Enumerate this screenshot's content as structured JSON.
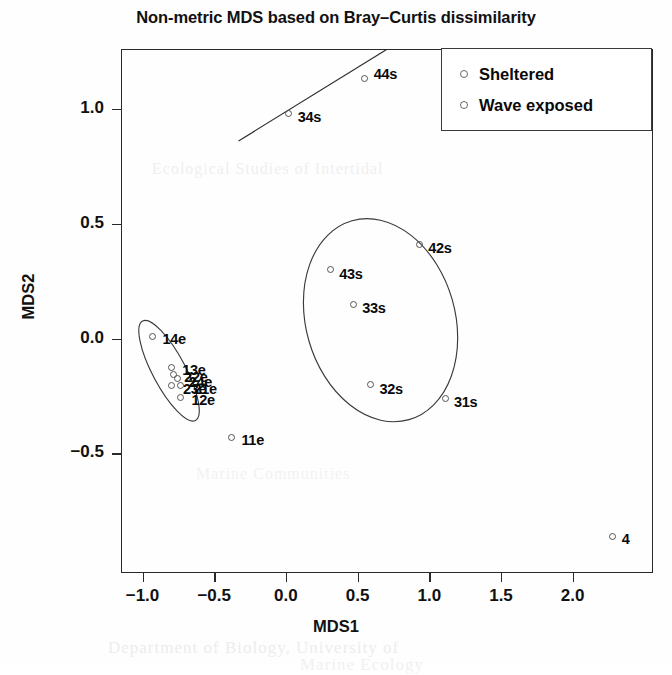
{
  "chart_data": {
    "type": "scatter",
    "title": "Non-metric MDS based on Bray–Curtis dissimilarity",
    "xlabel": "MDS1",
    "ylabel": "MDS2",
    "xlim": [
      -1.15,
      2.56
    ],
    "ylim": [
      -1.02,
      1.26
    ],
    "xticks": [
      "-1.0",
      "-0.5",
      "0.0",
      "0.5",
      "1.0",
      "1.5",
      "2.0"
    ],
    "xtickvalues": [
      -1.0,
      -0.5,
      0.0,
      0.5,
      1.0,
      1.5,
      2.0
    ],
    "yticks": [
      "-0.5",
      "0.0",
      "0.5",
      "1.0"
    ],
    "ytickvalues": [
      -0.5,
      0.0,
      0.5,
      1.0
    ],
    "grid": false,
    "legend_position": "top-right",
    "marker": "open-circle",
    "series": [
      {
        "name": "Sheltered",
        "suffix": "s",
        "points": [
          {
            "label": "44s",
            "x": 0.55,
            "y": 1.13,
            "label_dx": 9,
            "label_dy": -13
          },
          {
            "label": "34s",
            "x": 0.02,
            "y": 0.98,
            "label_dx": 9,
            "label_dy": -4
          },
          {
            "label": "42s",
            "x": 0.93,
            "y": 0.41,
            "label_dx": 9,
            "label_dy": -4
          },
          {
            "label": "43s",
            "x": 0.31,
            "y": 0.3,
            "label_dx": 9,
            "label_dy": -4
          },
          {
            "label": "33s",
            "x": 0.47,
            "y": 0.15,
            "label_dx": 9,
            "label_dy": -4
          },
          {
            "label": "32s",
            "x": 0.59,
            "y": -0.2,
            "label_dx": 9,
            "label_dy": -4
          },
          {
            "label": "31s",
            "x": 1.11,
            "y": -0.26,
            "label_dx": 9,
            "label_dy": -4
          },
          {
            "label": "4",
            "x": 2.28,
            "y": -0.86,
            "label_dx": 9,
            "label_dy": -5
          }
        ]
      },
      {
        "name": "Wave exposed",
        "suffix": "e",
        "points": [
          {
            "label": "14e",
            "x": -0.93,
            "y": 0.01,
            "label_dx": 10,
            "label_dy": -5
          },
          {
            "label": "13e",
            "x": -0.8,
            "y": -0.125,
            "label_dx": 11,
            "label_dy": -5
          },
          {
            "label": "22e",
            "x": -0.785,
            "y": -0.155,
            "label_dx": 11,
            "label_dy": -5
          },
          {
            "label": "24e",
            "x": -0.755,
            "y": -0.175,
            "label_dx": 11,
            "label_dy": -5
          },
          {
            "label": "23e",
            "x": -0.795,
            "y": -0.205,
            "label_dx": 11,
            "label_dy": -5
          },
          {
            "label": "21e",
            "x": -0.735,
            "y": -0.205,
            "label_dx": 13,
            "label_dy": -5
          },
          {
            "label": "12e",
            "x": -0.735,
            "y": -0.255,
            "label_dx": 11,
            "label_dy": -5
          },
          {
            "label": "11e",
            "x": -0.38,
            "y": -0.43,
            "label_dx": 10,
            "label_dy": -5
          }
        ]
      }
    ],
    "hulls": [
      {
        "name": "sheltered-ellipse",
        "shape": "ellipse",
        "cx": 0.66,
        "cy": 0.08,
        "rx": 0.52,
        "ry": 0.45,
        "rotation_deg": -16
      },
      {
        "name": "wave-exposed-ellipse",
        "shape": "ellipse",
        "cx": -0.815,
        "cy": -0.14,
        "rx": 0.115,
        "ry": 0.245,
        "rotation_deg": -28
      },
      {
        "name": "sheltered-pair-line",
        "shape": "line",
        "x1": -0.33,
        "y1": 0.86,
        "x2": 0.76,
        "y2": 1.28
      }
    ]
  },
  "legend": {
    "items": [
      {
        "label": "Sheltered",
        "marker": "open-circle"
      },
      {
        "label": "Wave exposed",
        "marker": "open-circle"
      }
    ]
  },
  "background_text": {
    "lines": [
      {
        "text": "Ecological Studies of Intertidal",
        "x": 152,
        "y": 160,
        "size": 16,
        "opacity": 0.28
      },
      {
        "text": "Marine Communities",
        "x": 196,
        "y": 465,
        "size": 16,
        "opacity": 0.22
      },
      {
        "text": "Department of Biology, University of",
        "x": 108,
        "y": 638,
        "size": 17,
        "opacity": 0.32
      },
      {
        "text": "Marine Ecology",
        "x": 300,
        "y": 655,
        "size": 17,
        "opacity": 0.26
      }
    ]
  }
}
